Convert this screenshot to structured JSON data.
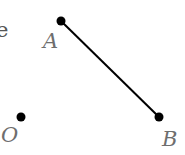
{
  "diagram": {
    "fragment_text": "e",
    "points": [
      {
        "name": "A",
        "x": 61,
        "y": 21,
        "label_x": 44,
        "label_y": 48
      },
      {
        "name": "B",
        "x": 159,
        "y": 117,
        "label_x": 162,
        "label_y": 147
      },
      {
        "name": "O",
        "x": 21,
        "y": 117,
        "label_x": 1,
        "label_y": 142
      }
    ],
    "segments": [
      {
        "from": "A",
        "to": "B"
      }
    ],
    "colors": {
      "line": "#000000",
      "point": "#000000",
      "label": "#6e6e6e"
    }
  }
}
